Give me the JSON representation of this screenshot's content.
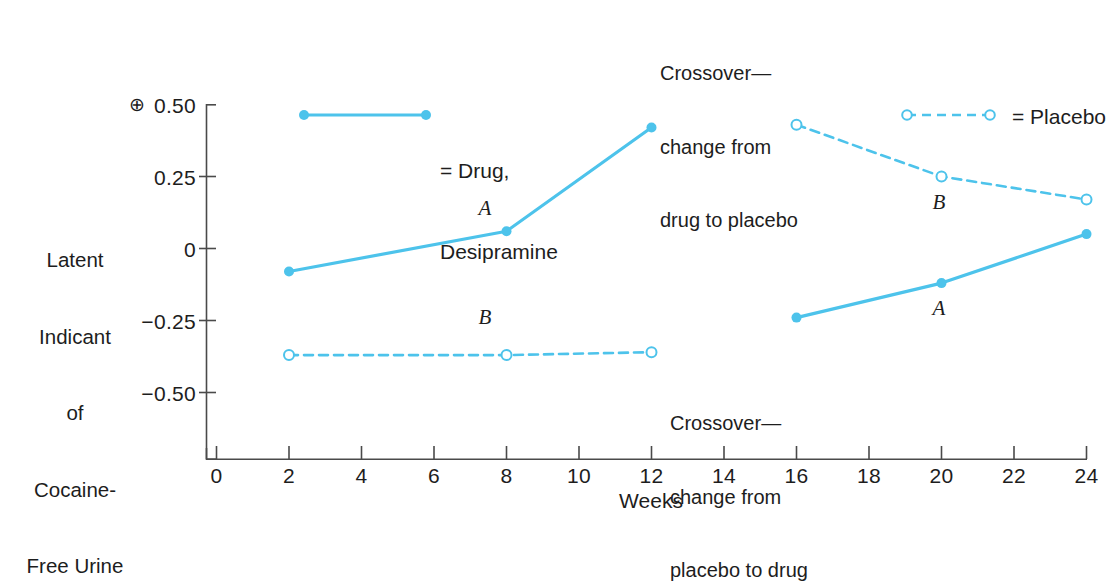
{
  "chart_data": {
    "type": "line",
    "title": "",
    "xlabel": "Weeks",
    "ylabel": "Latent Indicant of Cocaine-Free Urine",
    "xlim": [
      0,
      24
    ],
    "ylim": [
      -0.62,
      0.58
    ],
    "xticks": [
      "0",
      "2",
      "4",
      "6",
      "8",
      "10",
      "12",
      "14",
      "16",
      "18",
      "20",
      "22",
      "24"
    ],
    "yticks": [
      "0.50",
      "0.25",
      "0",
      "−0.25",
      "−0.50"
    ],
    "ytick_values": [
      0.5,
      0.25,
      0,
      -0.25,
      -0.5
    ],
    "grid": false,
    "legend_position": "inside-top",
    "positive_marker": "⊕",
    "series": [
      {
        "name": "Drug, Desipramine",
        "group_label": "A",
        "style": "solid",
        "marker": "filled-circle",
        "color": "#4DC3EB",
        "segments": [
          {
            "phase": "pre-crossover",
            "x": [
              2,
              8,
              12
            ],
            "y": [
              -0.08,
              0.06,
              0.42
            ]
          },
          {
            "phase": "post-crossover",
            "x": [
              16,
              20,
              24
            ],
            "y": [
              -0.24,
              -0.12,
              0.05
            ]
          }
        ]
      },
      {
        "name": "Placebo",
        "group_label": "B",
        "style": "dashed",
        "marker": "open-circle",
        "color": "#4DC3EB",
        "segments": [
          {
            "phase": "pre-crossover",
            "x": [
              2,
              8,
              12
            ],
            "y": [
              -0.37,
              -0.37,
              -0.36
            ]
          },
          {
            "phase": "post-crossover",
            "x": [
              16,
              20,
              24
            ],
            "y": [
              0.43,
              0.25,
              0.17
            ]
          }
        ]
      }
    ],
    "annotations": [
      {
        "name": "crossover-top",
        "text": "Crossover—\nchange from\ndrug to placebo"
      },
      {
        "name": "crossover-bottom",
        "text": "Crossover—\nchange from\nplacebo to drug"
      },
      {
        "name": "series-label-a-left",
        "text": "A"
      },
      {
        "name": "series-label-b-left",
        "text": "B"
      },
      {
        "name": "series-label-a-right",
        "text": "A"
      },
      {
        "name": "series-label-b-right",
        "text": "B"
      }
    ]
  },
  "axes": {
    "y_title_lines": [
      "Latent",
      "Indicant",
      "of",
      "Cocaine-",
      "Free Urine"
    ],
    "y_tick_labels": [
      "0.50",
      "0.25",
      "0",
      "−0.25",
      "−0.50"
    ],
    "x_tick_labels": [
      "0",
      "2",
      "4",
      "6",
      "8",
      "10",
      "12",
      "14",
      "16",
      "18",
      "20",
      "22",
      "24"
    ],
    "x_title": "Weeks",
    "positive_direction_symbol": "⊕"
  },
  "legend": {
    "drug": {
      "line1": "= Drug,",
      "line2": "Desipramine"
    },
    "placebo": {
      "line1": "= Placebo"
    }
  },
  "annotations": {
    "crossover_top": {
      "line1": "Crossover—",
      "line2": "change from",
      "line3": "drug to placebo"
    },
    "crossover_bottom": {
      "line1": "Crossover—",
      "line2": "change from",
      "line3": "placebo to drug"
    }
  },
  "series_labels": {
    "a_left": "A",
    "b_left": "B",
    "a_right": "A",
    "b_right": "B"
  },
  "colors": {
    "series": "#4DC3EB",
    "axis": "#4a4a4a",
    "text": "#1d1d1d"
  }
}
